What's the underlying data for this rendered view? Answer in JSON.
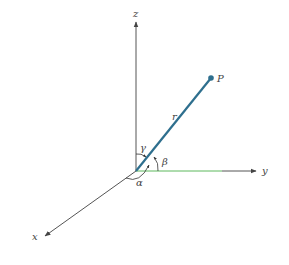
{
  "diagram": {
    "type": "3d-coordinate-direction-angles",
    "axes": {
      "x": {
        "label": "x"
      },
      "y": {
        "label": "y"
      },
      "z": {
        "label": "z"
      }
    },
    "point": {
      "label": "P"
    },
    "vector": {
      "label": "r"
    },
    "angles": {
      "alpha": "α",
      "beta": "β",
      "gamma": "γ"
    },
    "colors": {
      "axis": "#555555",
      "vector": "#2e6f8e",
      "y_projection": "#5cb85c",
      "background": "#ffffff"
    }
  }
}
